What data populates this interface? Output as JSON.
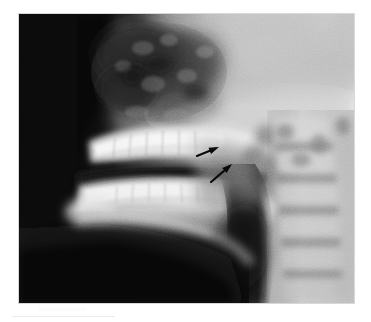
{
  "page": {
    "background_color": "#ffffff",
    "width": 371,
    "height": 322
  },
  "figure": {
    "type": "radiograph",
    "modality": "X-ray",
    "view": "lateral cephalometric",
    "region": "head and neck",
    "caption": "",
    "frame": {
      "x": 19,
      "y": 14,
      "width": 335,
      "height": 289,
      "border_color": "#d8d8d8"
    },
    "tone": {
      "background_dark": "#070707",
      "soft_tissue_mid": "#8a8a8a",
      "bone_bright": "#efefef",
      "airway_dark": "#2a2a2a",
      "skull_base_light": "#d2d2d2"
    }
  },
  "annotations": {
    "label": "arrow-markers",
    "color": "#0a0a0a",
    "count": 2,
    "description": "Two black arrows indicating a soft-tissue region posterior to the mandible",
    "arrows": [
      {
        "name": "arrow-upper",
        "tail_x": 178,
        "tail_y": 142,
        "head_x": 200,
        "head_y": 133,
        "length": 24,
        "angle_deg": -22
      },
      {
        "name": "arrow-lower",
        "tail_x": 192,
        "tail_y": 168,
        "head_x": 213,
        "head_y": 150,
        "length": 28,
        "angle_deg": -40
      }
    ]
  },
  "anatomy_regions": [
    {
      "name": "air-background",
      "label": "Air / background",
      "shade": "#060606"
    },
    {
      "name": "facial-profile",
      "label": "Facial soft-tissue profile",
      "shade": "#9a9a9a"
    },
    {
      "name": "nasal-sinus",
      "label": "Nasal cavity and sinuses",
      "shade": "#4a4a4a"
    },
    {
      "name": "maxillary-teeth",
      "label": "Maxillary dentition",
      "shade": "#f2f2f2"
    },
    {
      "name": "mandibular-teeth",
      "label": "Mandibular dentition",
      "shade": "#eeeeee"
    },
    {
      "name": "occlusal-gap",
      "label": "Occlusal plane gap",
      "shade": "#2f2f2f"
    },
    {
      "name": "mandible-body",
      "label": "Mandible body and ramus",
      "shade": "#e4e4e4"
    },
    {
      "name": "oropharyngeal-airway",
      "label": "Oropharyngeal airway",
      "shade": "#242424"
    },
    {
      "name": "cervical-spine",
      "label": "Cervical vertebrae",
      "shade": "#c9c9c9"
    },
    {
      "name": "skull-base",
      "label": "Skull base",
      "shade": "#d6d6d6"
    },
    {
      "name": "submandibular",
      "label": "Submandibular soft tissue",
      "shade": "#151515"
    }
  ],
  "artifacts": {
    "scan_line_label": "scan edge artifact",
    "scan_line_color": "#ececec"
  }
}
